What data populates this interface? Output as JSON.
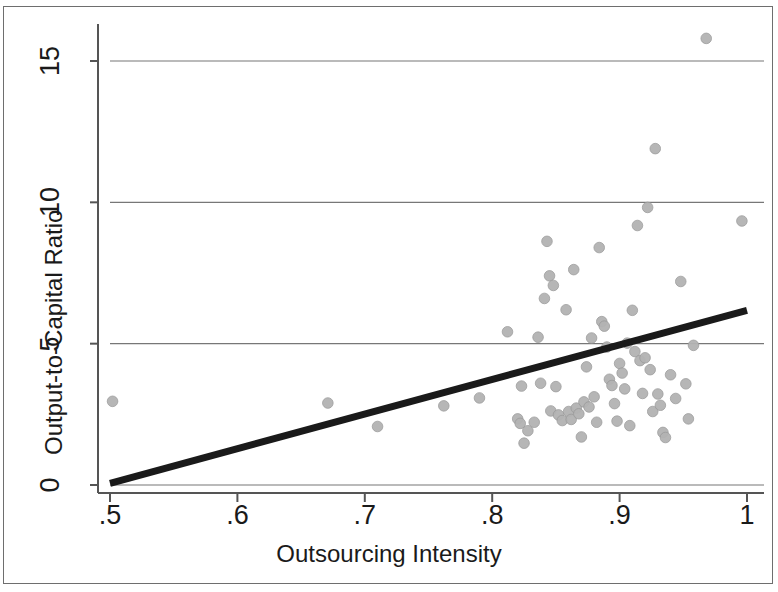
{
  "chart_data": {
    "type": "scatter",
    "title": "",
    "xlabel": "Outsourcing Intensity",
    "ylabel": "Output-to-Capital Ratio",
    "xlim": [
      0.5,
      1.0
    ],
    "ylim": [
      -0.6,
      16.6
    ],
    "xticks": [
      0.5,
      0.6,
      0.7,
      0.8,
      0.9,
      1.0
    ],
    "xtick_labels": [
      ".5",
      ".6",
      ".7",
      ".8",
      ".9",
      "1"
    ],
    "yticks": [
      0,
      5,
      10,
      15
    ],
    "ytick_labels": [
      "0",
      "5",
      "10",
      "15"
    ],
    "grid": "horizontal",
    "legend": "none",
    "marker_color": "#b3b3b3",
    "marker_edge_color": "#999999",
    "fit_line_color": "#1a1a1a",
    "axis_color": "#555555",
    "grid_color": "#777777",
    "series": [
      {
        "name": "Firms",
        "type": "scatter",
        "points": [
          [
            0.502,
            2.96
          ],
          [
            0.671,
            2.9
          ],
          [
            0.71,
            2.07
          ],
          [
            0.762,
            2.8
          ],
          [
            0.79,
            3.08
          ],
          [
            0.812,
            5.42
          ],
          [
            0.82,
            2.34
          ],
          [
            0.822,
            2.18
          ],
          [
            0.823,
            3.5
          ],
          [
            0.825,
            1.48
          ],
          [
            0.828,
            1.92
          ],
          [
            0.833,
            2.22
          ],
          [
            0.836,
            5.23
          ],
          [
            0.838,
            3.6
          ],
          [
            0.841,
            6.6
          ],
          [
            0.843,
            8.62
          ],
          [
            0.845,
            7.4
          ],
          [
            0.846,
            2.62
          ],
          [
            0.848,
            7.06
          ],
          [
            0.85,
            3.48
          ],
          [
            0.852,
            2.48
          ],
          [
            0.855,
            2.28
          ],
          [
            0.858,
            6.2
          ],
          [
            0.86,
            2.6
          ],
          [
            0.862,
            2.32
          ],
          [
            0.864,
            7.62
          ],
          [
            0.866,
            2.72
          ],
          [
            0.868,
            2.52
          ],
          [
            0.87,
            1.7
          ],
          [
            0.872,
            2.94
          ],
          [
            0.874,
            4.18
          ],
          [
            0.876,
            2.76
          ],
          [
            0.878,
            5.2
          ],
          [
            0.88,
            3.12
          ],
          [
            0.882,
            2.22
          ],
          [
            0.884,
            8.4
          ],
          [
            0.886,
            5.78
          ],
          [
            0.888,
            5.62
          ],
          [
            0.89,
            4.88
          ],
          [
            0.892,
            3.74
          ],
          [
            0.894,
            3.52
          ],
          [
            0.896,
            2.88
          ],
          [
            0.898,
            2.26
          ],
          [
            0.9,
            4.3
          ],
          [
            0.902,
            3.96
          ],
          [
            0.904,
            3.4
          ],
          [
            0.906,
            5.02
          ],
          [
            0.908,
            2.1
          ],
          [
            0.91,
            6.18
          ],
          [
            0.912,
            4.72
          ],
          [
            0.914,
            9.18
          ],
          [
            0.916,
            4.4
          ],
          [
            0.918,
            3.24
          ],
          [
            0.92,
            4.5
          ],
          [
            0.922,
            9.82
          ],
          [
            0.924,
            4.08
          ],
          [
            0.926,
            2.6
          ],
          [
            0.928,
            11.9
          ],
          [
            0.93,
            3.22
          ],
          [
            0.932,
            2.82
          ],
          [
            0.934,
            1.86
          ],
          [
            0.936,
            1.68
          ],
          [
            0.94,
            3.9
          ],
          [
            0.944,
            3.06
          ],
          [
            0.948,
            7.2
          ],
          [
            0.952,
            3.58
          ],
          [
            0.954,
            2.34
          ],
          [
            0.958,
            4.94
          ],
          [
            0.968,
            15.8
          ],
          [
            0.996,
            9.34
          ]
        ]
      },
      {
        "name": "Fitted line",
        "type": "line",
        "points": [
          [
            0.5,
            0.06
          ],
          [
            1.0,
            6.18
          ]
        ]
      }
    ]
  },
  "figure": {
    "xlabel": "Outsourcing Intensity",
    "ylabel": "Output-to-Capital Ratio"
  }
}
